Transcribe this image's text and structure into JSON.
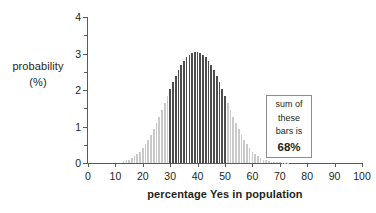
{
  "chart_data": {
    "type": "bar",
    "title": "",
    "subtitle": "",
    "xlabel": "percentage Yes in population",
    "ylabel_line1": "probability",
    "ylabel_line2": "(%)",
    "xlim": [
      0,
      100
    ],
    "ylim": [
      0,
      4
    ],
    "xticks": [
      0,
      10,
      20,
      30,
      40,
      50,
      60,
      70,
      80,
      90,
      100
    ],
    "yticks": [
      0,
      1,
      2,
      3,
      4
    ],
    "yticks_minor": [
      0.5,
      1.5,
      2.5,
      3.5
    ],
    "grid": false,
    "legend": null,
    "distribution": {
      "mean": 40,
      "sd": 10,
      "peak_value": 3.8
    },
    "highlight_range": [
      30,
      50
    ],
    "highlight_color": "#4d4d4d",
    "bar_color": "#c9c9c9",
    "axis_color": "#595959",
    "x": [
      13,
      14,
      15,
      16,
      17,
      18,
      19,
      20,
      21,
      22,
      23,
      24,
      25,
      26,
      27,
      28,
      29,
      30,
      31,
      32,
      33,
      34,
      35,
      36,
      37,
      38,
      39,
      40,
      41,
      42,
      43,
      44,
      45,
      46,
      47,
      48,
      49,
      50,
      51,
      52,
      53,
      54,
      55,
      56,
      57,
      58,
      59,
      60,
      61,
      62,
      63,
      64,
      65,
      66,
      67,
      68,
      69,
      70,
      71,
      72,
      73
    ],
    "values": [
      0.05,
      0.07,
      0.09,
      0.13,
      0.18,
      0.24,
      0.31,
      0.4,
      0.51,
      0.63,
      0.77,
      0.92,
      1.09,
      1.27,
      1.45,
      1.65,
      1.84,
      2.03,
      2.21,
      2.38,
      2.54,
      2.68,
      2.8,
      2.9,
      2.97,
      3.01,
      3.03,
      3.03,
      3.01,
      2.97,
      2.9,
      2.8,
      2.68,
      2.54,
      2.38,
      2.21,
      2.03,
      1.84,
      1.65,
      1.45,
      1.27,
      1.09,
      0.92,
      0.77,
      0.63,
      0.51,
      0.4,
      0.31,
      0.24,
      0.18,
      0.13,
      0.09,
      0.07,
      0.05,
      0.04,
      0.03,
      0.02,
      0.015,
      0.01,
      0.007,
      0.005
    ],
    "peak_display": [
      3.78,
      3.8,
      3.78
    ]
  },
  "annotation": {
    "line1": "sum of",
    "line2": "these",
    "line3": "bars is",
    "line4": "68%"
  }
}
